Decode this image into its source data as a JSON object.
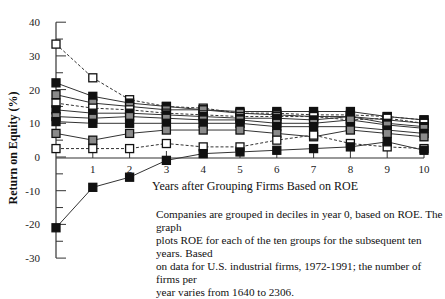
{
  "chart_data": {
    "type": "line",
    "title": "",
    "xlabel": "Years after Grouping Firms Based on ROE",
    "ylabel": "Return on Equity (%)",
    "x": [
      0,
      1,
      2,
      3,
      4,
      5,
      6,
      7,
      8,
      9,
      10
    ],
    "xticks": [
      "1",
      "2",
      "3",
      "4",
      "5",
      "6",
      "7",
      "8",
      "9",
      "10"
    ],
    "yticks": [
      "40",
      "30",
      "20",
      "10",
      "0",
      "-10",
      "-20",
      "-30"
    ],
    "xlim": [
      0,
      10
    ],
    "ylim": [
      -30,
      40
    ],
    "grid": false,
    "legend": "none",
    "series": [
      {
        "name": "Decile 10 (highest)",
        "marker": "white",
        "dashed": true,
        "values": [
          33.5,
          23.5,
          17,
          15,
          14.5,
          13,
          13,
          12.5,
          12.5,
          12,
          11
        ]
      },
      {
        "name": "Decile 9",
        "marker": "black",
        "dashed": false,
        "values": [
          22,
          18,
          16,
          15,
          14,
          13.5,
          13.5,
          13.5,
          13.5,
          12,
          11
        ]
      },
      {
        "name": "Decile 8",
        "marker": "gray",
        "dashed": false,
        "values": [
          18.5,
          16,
          15,
          14,
          14,
          13,
          12.5,
          12,
          12,
          11,
          10
        ]
      },
      {
        "name": "Decile 7",
        "marker": "white",
        "dashed": true,
        "values": [
          16,
          14.5,
          14,
          13,
          12.5,
          12,
          12,
          12,
          11,
          11.5,
          10
        ]
      },
      {
        "name": "Decile 6",
        "marker": "black",
        "dashed": false,
        "values": [
          14,
          13,
          13,
          12.5,
          12,
          11.5,
          11.5,
          11,
          12,
          10,
          9
        ]
      },
      {
        "name": "Decile 5",
        "marker": "gray",
        "dashed": false,
        "values": [
          12,
          11.5,
          12,
          11.5,
          11,
          11,
          10,
          10,
          11,
          9.5,
          8.5
        ]
      },
      {
        "name": "Decile 4",
        "marker": "black",
        "dashed": false,
        "values": [
          10.5,
          10,
          10,
          10,
          10,
          10,
          9,
          9,
          9,
          8,
          7
        ]
      },
      {
        "name": "Decile 3",
        "marker": "gray",
        "dashed": false,
        "values": [
          7,
          5,
          7,
          8,
          8,
          8,
          7,
          6,
          8,
          7,
          6
        ]
      },
      {
        "name": "Decile 2",
        "marker": "white",
        "dashed": true,
        "values": [
          2.5,
          2.5,
          2.5,
          4,
          3,
          3,
          5,
          6.5,
          4,
          3,
          2.5
        ]
      },
      {
        "name": "Decile 1 (lowest)",
        "marker": "black",
        "dashed": false,
        "values": [
          -21,
          -9,
          -6,
          -1,
          1,
          1.5,
          2,
          2.5,
          3,
          4.5,
          2
        ]
      }
    ],
    "caption": "Companies are grouped in deciles in year 0, based on ROE. The graph plots ROE for each of the ten groups for the subsequent ten years. Based on data for U.S. industrial firms, 1972-1991; the number of firms per year varies from 1640 to 2306."
  },
  "colors": {
    "black": "#111111",
    "gray": "#8a8a8a",
    "white": "#ffffff",
    "line": "#333333"
  },
  "caption_lines": [
    "Companies are grouped in deciles in year 0, based on ROE. The graph",
    "plots ROE for each of the ten groups for the subsequent ten years. Based",
    "on data for U.S. industrial firms, 1972-1991; the number of firms per",
    "year varies from 1640 to 2306."
  ]
}
